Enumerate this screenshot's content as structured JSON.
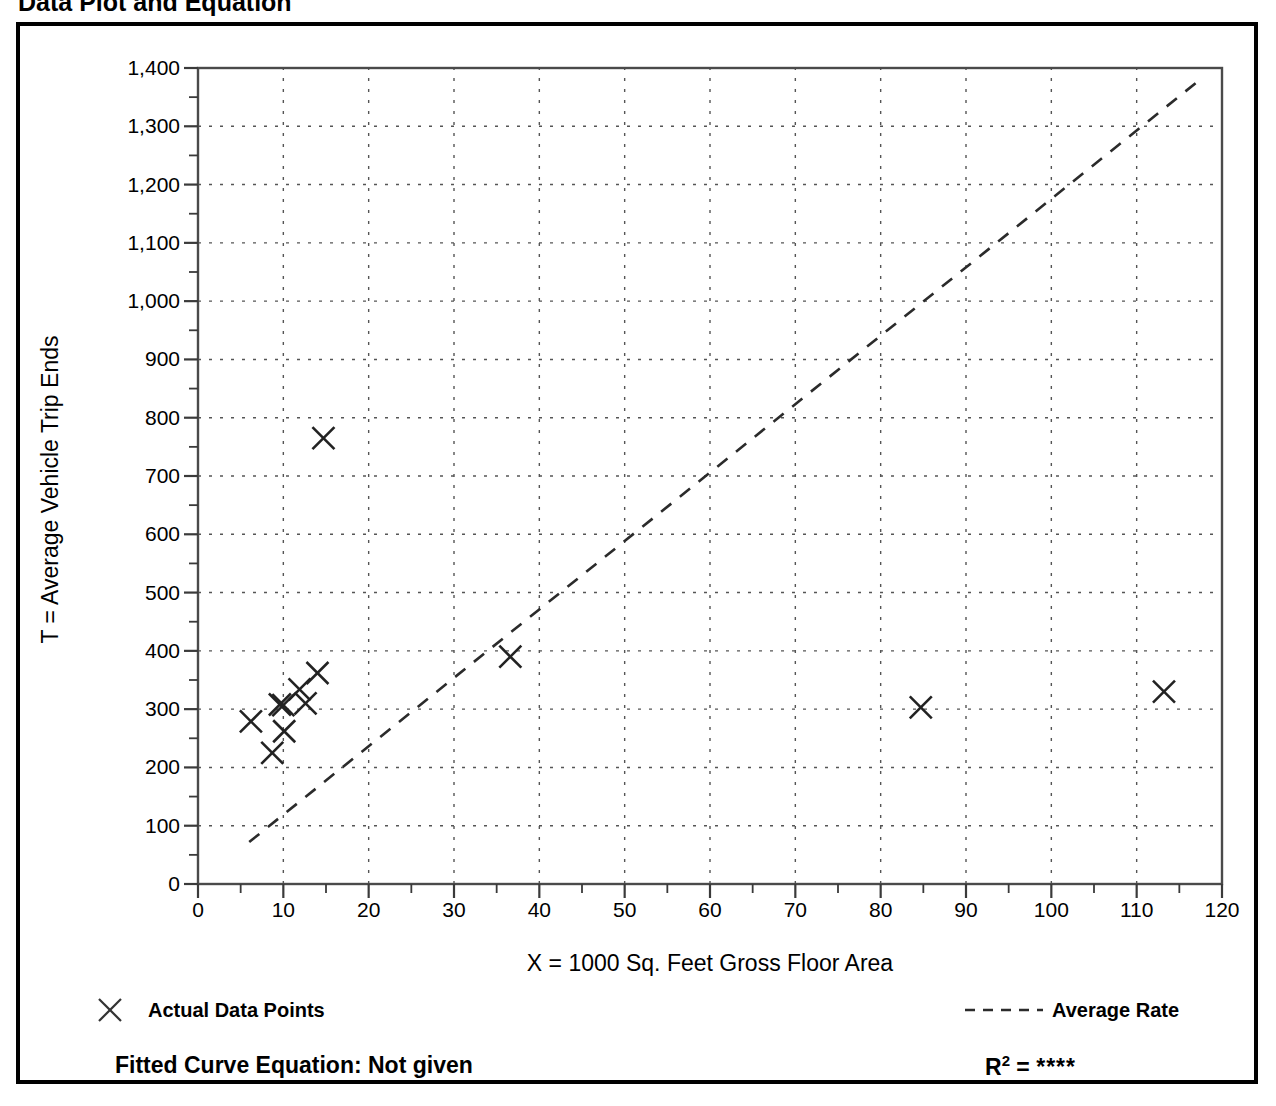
{
  "page": {
    "title": "Data Plot and Equation"
  },
  "chart_data": {
    "type": "scatter",
    "title": "Data Plot and Equation",
    "xlabel": "X = 1000 Sq. Feet Gross Floor Area",
    "ylabel": "T = Average Vehicle Trip Ends",
    "xlim": [
      0,
      120
    ],
    "ylim": [
      0,
      1400
    ],
    "xticks": [
      0,
      10,
      20,
      30,
      40,
      50,
      60,
      70,
      80,
      90,
      100,
      110,
      120
    ],
    "yticks": [
      0,
      100,
      200,
      300,
      400,
      500,
      600,
      700,
      800,
      900,
      1000,
      1100,
      1200,
      1300,
      1400
    ],
    "ytick_labels": [
      "0",
      "100",
      "200",
      "300",
      "400",
      "500",
      "600",
      "700",
      "800",
      "900",
      "1,000",
      "1,100",
      "1,200",
      "1,300",
      "1,400"
    ],
    "xtick_labels": [
      "0",
      "10",
      "20",
      "30",
      "40",
      "50",
      "60",
      "70",
      "80",
      "90",
      "100",
      "110",
      "120"
    ],
    "minor_tick_step_x": 5,
    "minor_tick_step_y": 50,
    "grid": true,
    "grid_style": "dotted",
    "grid_color": "#555555",
    "marker": "x",
    "marker_color": "#222222",
    "series": [
      {
        "name": "Actual Data Points",
        "type": "scatter",
        "points": [
          {
            "x": 6.2,
            "y": 279
          },
          {
            "x": 8.7,
            "y": 225
          },
          {
            "x": 9.6,
            "y": 308
          },
          {
            "x": 10.0,
            "y": 307
          },
          {
            "x": 10.1,
            "y": 262
          },
          {
            "x": 11.9,
            "y": 334
          },
          {
            "x": 12.6,
            "y": 310
          },
          {
            "x": 14.0,
            "y": 362
          },
          {
            "x": 14.7,
            "y": 765
          },
          {
            "x": 36.6,
            "y": 390
          },
          {
            "x": 84.7,
            "y": 303
          },
          {
            "x": 113.2,
            "y": 330
          }
        ]
      },
      {
        "name": "Average Rate",
        "type": "line",
        "style": "dashed",
        "endpoints": [
          {
            "x": 6.0,
            "y": 72
          },
          {
            "x": 117.0,
            "y": 1375
          }
        ]
      }
    ],
    "legend": [
      {
        "key": "legend-points",
        "label": "Actual Data Points",
        "marker": "x",
        "position": "bottom-left"
      },
      {
        "key": "legend-line",
        "label": "Average Rate",
        "marker": "dashed-line",
        "position": "bottom-right"
      }
    ],
    "annotations": {
      "fitted_curve_equation": "Fitted Curve Equation:  Not given",
      "r_squared_symbol": "R",
      "r_squared_exponent": "2",
      "r_squared_equals": " = ",
      "r_squared_value": "****"
    }
  }
}
